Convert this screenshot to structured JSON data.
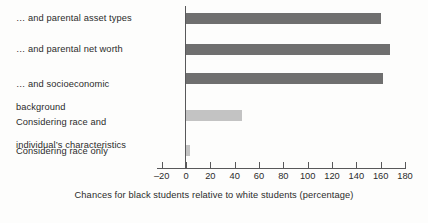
{
  "chart_data": {
    "type": "bar",
    "orientation": "horizontal",
    "title": "",
    "subtitle": "",
    "xlabel": "Chances for black students relative to white students (percentage)",
    "ylabel": "",
    "xlim": [
      -20,
      180
    ],
    "xticks": [
      -20,
      0,
      20,
      40,
      60,
      80,
      100,
      120,
      140,
      160,
      180
    ],
    "xtick_labels": [
      "–20",
      "0",
      "20",
      "40",
      "60",
      "80",
      "100",
      "120",
      "140",
      "160",
      "180"
    ],
    "grid": false,
    "legend": null,
    "categories": [
      "… and parental asset types",
      "… and parental net worth",
      "…  and socioeconomic\nbackground",
      "Considering race and\nindividual’s characteristics",
      "Considering race only"
    ],
    "values": [
      160,
      168,
      162,
      46,
      3
    ],
    "bar_colors": [
      "#6f6f6f",
      "#6f6f6f",
      "#6f6f6f",
      "#c3c3c3",
      "#c3c3c3"
    ],
    "colors": {
      "bar_dark": "#6f6f6f",
      "bar_light": "#c3c3c3",
      "axis": "#58585a",
      "text": "#2b2b2b",
      "background": "#fdfdfc"
    }
  },
  "labels": {
    "bar_1": "… and parental asset types",
    "bar_2": "… and parental net worth",
    "bar_3_line_1": "…  and socioeconomic",
    "bar_3_line_2": "background",
    "bar_4_line_1": "Considering race and",
    "bar_4_line_2": "individual’s characteristics",
    "bar_5": "Considering race only"
  },
  "axis": {
    "title": "Chances for black students relative to white students (percentage)",
    "ticks": [
      "–20",
      "0",
      "20",
      "40",
      "60",
      "80",
      "100",
      "120",
      "140",
      "160",
      "180"
    ]
  }
}
